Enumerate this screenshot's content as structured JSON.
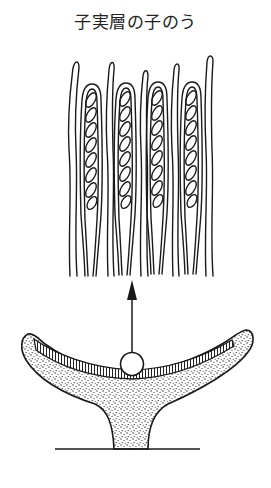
{
  "title": "子実層の子のう",
  "diagram": {
    "parts": [
      {
        "name": "hymenium-detail",
        "description": "asci containing 8 ascospores each, alternating with paraphyses"
      },
      {
        "name": "arrow",
        "description": "points from selected hymenium region up to magnified detail"
      },
      {
        "name": "highlight-circle",
        "description": "circle marking region of hymenium magnified above"
      },
      {
        "name": "apothecium-cup",
        "description": "stippled cup-shaped fruiting body with hatched hymenium layer"
      },
      {
        "name": "ground-line",
        "description": "substrate surface"
      }
    ],
    "asci_count": 4,
    "paraphyses_count": 5,
    "spores_per_ascus": 8,
    "colors": {
      "ink": "#1a1a1a",
      "background": "#ffffff"
    }
  }
}
